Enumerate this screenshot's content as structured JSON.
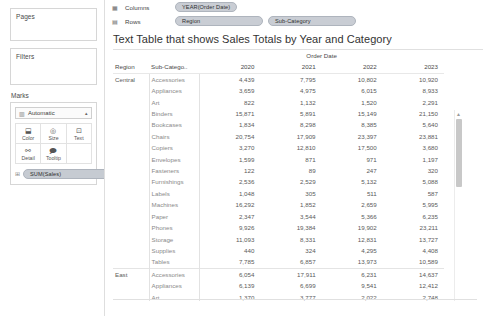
{
  "sidebar": {
    "pages": {
      "title": "Pages"
    },
    "filters": {
      "title": "Filters"
    },
    "marks": {
      "title": "Marks",
      "type_label": "Automatic",
      "type_glyph": "▥",
      "caret": "▴",
      "buttons": [
        {
          "name": "color",
          "label": "Color",
          "glyph": "⬓"
        },
        {
          "name": "size",
          "label": "Size",
          "glyph": "◎"
        },
        {
          "name": "text",
          "label": "Text",
          "glyph": "⊡"
        },
        {
          "name": "detail",
          "label": "Detail",
          "glyph": "⚯"
        },
        {
          "name": "tooltip",
          "label": "Tooltip",
          "glyph": "🗩"
        }
      ],
      "pill": {
        "grip": "⊞",
        "label": "SUM(Sales)"
      }
    }
  },
  "shelves": {
    "columns": {
      "icon": "▦",
      "label": "Columns",
      "pills": [
        {
          "grip": "⊞",
          "label": "YEAR(Order Date)"
        }
      ]
    },
    "rows": {
      "icon": "▤",
      "label": "Rows",
      "pills": [
        {
          "grip": "⊞",
          "label": "Region"
        },
        {
          "grip": "⊞",
          "label": "Sub-Category"
        }
      ]
    }
  },
  "viz": {
    "title": "Text Table that shows Sales Totals by Year and Category",
    "column_group_header": "Order Date",
    "headers": {
      "region": "Region",
      "sub_category": "Sub-Catego..",
      "years": [
        "2020",
        "2021",
        "2022",
        "2023"
      ]
    },
    "rows": [
      {
        "region": "Central",
        "sub_category": "Accessories",
        "values": [
          "4,439",
          "7,795",
          "10,802",
          "10,920"
        ],
        "region_start": true
      },
      {
        "region": "",
        "sub_category": "Appliances",
        "values": [
          "3,659",
          "4,975",
          "6,015",
          "8,933"
        ]
      },
      {
        "region": "",
        "sub_category": "Art",
        "values": [
          "822",
          "1,132",
          "1,520",
          "2,291"
        ]
      },
      {
        "region": "",
        "sub_category": "Binders",
        "values": [
          "15,871",
          "5,891",
          "15,149",
          "21,150"
        ]
      },
      {
        "region": "",
        "sub_category": "Bookcases",
        "values": [
          "1,834",
          "8,298",
          "8,385",
          "5,640"
        ]
      },
      {
        "region": "",
        "sub_category": "Chairs",
        "values": [
          "20,754",
          "17,909",
          "23,397",
          "23,881"
        ]
      },
      {
        "region": "",
        "sub_category": "Copiers",
        "values": [
          "3,270",
          "12,810",
          "17,500",
          "3,680"
        ]
      },
      {
        "region": "",
        "sub_category": "Envelopes",
        "values": [
          "1,599",
          "871",
          "971",
          "1,197"
        ]
      },
      {
        "region": "",
        "sub_category": "Fasteners",
        "values": [
          "122",
          "89",
          "247",
          "320"
        ]
      },
      {
        "region": "",
        "sub_category": "Furnishings",
        "values": [
          "2,536",
          "2,529",
          "5,132",
          "5,088"
        ]
      },
      {
        "region": "",
        "sub_category": "Labels",
        "values": [
          "1,048",
          "305",
          "511",
          "587"
        ]
      },
      {
        "region": "",
        "sub_category": "Machines",
        "values": [
          "16,292",
          "1,852",
          "2,659",
          "5,995"
        ]
      },
      {
        "region": "",
        "sub_category": "Paper",
        "values": [
          "2,347",
          "3,544",
          "5,366",
          "6,235"
        ]
      },
      {
        "region": "",
        "sub_category": "Phones",
        "values": [
          "9,926",
          "19,384",
          "19,902",
          "23,211"
        ]
      },
      {
        "region": "",
        "sub_category": "Storage",
        "values": [
          "11,093",
          "8,331",
          "12,831",
          "13,727"
        ]
      },
      {
        "region": "",
        "sub_category": "Supplies",
        "values": [
          "440",
          "324",
          "4,295",
          "4,408"
        ]
      },
      {
        "region": "",
        "sub_category": "Tables",
        "values": [
          "7,785",
          "6,857",
          "13,973",
          "10,589"
        ]
      },
      {
        "region": "East",
        "sub_category": "Accessories",
        "values": [
          "6,054",
          "17,911",
          "6,231",
          "14,637"
        ],
        "region_start": true
      },
      {
        "region": "",
        "sub_category": "Appliances",
        "values": [
          "6,139",
          "6,699",
          "9,541",
          "12,412"
        ]
      },
      {
        "region": "",
        "sub_category": "Art",
        "values": [
          "1,370",
          "3,777",
          "2,022",
          "2,748"
        ]
      },
      {
        "region": "",
        "sub_category": "Binders",
        "values": [
          "7,319",
          "14,417",
          "19,760",
          "14,807"
        ]
      },
      {
        "region": "",
        "sub_category": "Bookcases",
        "values": [
          "10,883",
          "19,653",
          "6,037",
          "7,411"
        ]
      },
      {
        "region": "",
        "sub_category": "Chairs",
        "values": [
          "22,881",
          "20,034",
          "23,209",
          "31,393"
        ]
      },
      {
        "region": "",
        "sub_category": "Copiers",
        "values": [
          "5,300",
          "4,960",
          "19,760",
          "24,417"
        ]
      }
    ]
  },
  "scrollbar": {
    "up": "▲",
    "down": "▼"
  }
}
